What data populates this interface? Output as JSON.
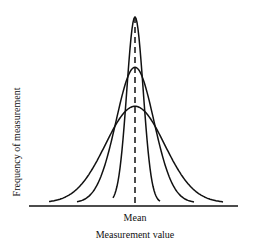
{
  "chart_data": {
    "type": "line",
    "title": "",
    "xlabel": "Measurement value",
    "ylabel": "Frequency of measurement",
    "x_tick_labels": [
      "Mean"
    ],
    "grid": false,
    "legend": null,
    "annotations": [
      "Dashed vertical line at the mean"
    ],
    "series": [
      {
        "name": "Narrow distribution (high precision)",
        "shape": "normal",
        "mean": 0,
        "relative_sd": 1.0,
        "relative_peak": 1.0
      },
      {
        "name": "Medium distribution",
        "shape": "normal",
        "mean": 0,
        "relative_sd": 2.3,
        "relative_peak": 0.73
      },
      {
        "name": "Wide distribution (low precision)",
        "shape": "normal",
        "mean": 0,
        "relative_sd": 3.6,
        "relative_peak": 0.52
      }
    ]
  },
  "labels": {
    "ylabel": "Frequency of measurement",
    "xtick": "Mean",
    "xlabel": "Measurement value"
  },
  "colors": {
    "line": "#111111",
    "background": "#ffffff"
  }
}
